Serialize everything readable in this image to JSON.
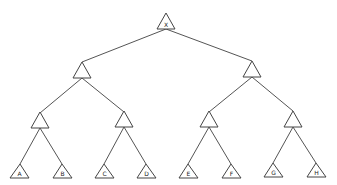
{
  "diagram": {
    "type": "binary-tree",
    "root": {
      "label": "X"
    },
    "levels": [
      [
        {
          "label": "X"
        }
      ],
      [
        {
          "label": ""
        },
        {
          "label": ""
        }
      ],
      [
        {
          "label": ""
        },
        {
          "label": ""
        },
        {
          "label": ""
        },
        {
          "label": ""
        }
      ],
      [
        {
          "label": "A"
        },
        {
          "label": "B"
        },
        {
          "label": "C"
        },
        {
          "label": "D"
        },
        {
          "label": "E"
        },
        {
          "label": "F"
        },
        {
          "label": "G"
        },
        {
          "label": "H"
        }
      ]
    ],
    "leaves": [
      "A",
      "B",
      "C",
      "D",
      "E",
      "F",
      "G",
      "H"
    ]
  }
}
